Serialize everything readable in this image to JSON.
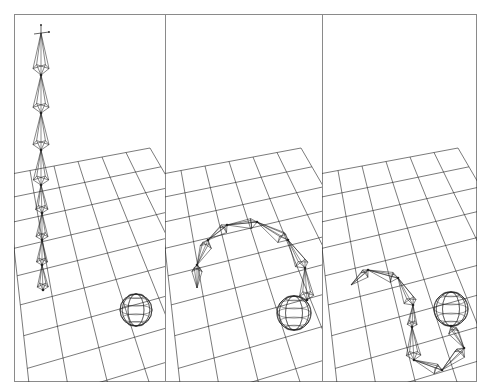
{
  "figure": {
    "colors": {
      "background": "#ffffff",
      "line": "#222222",
      "frame": "#8a8a8a"
    },
    "frame": {
      "x": 14,
      "y": 14,
      "width": 463,
      "height": 368
    },
    "panels": [
      {
        "id": "panel-1",
        "label": "Initial pose: chain straight up",
        "x": 14,
        "width": 151,
        "chain_joints": [
          [
            41,
            33
          ],
          [
            41,
            75
          ],
          [
            41,
            113
          ],
          [
            41,
            150
          ],
          [
            41,
            185
          ],
          [
            42,
            213
          ],
          [
            42,
            240
          ],
          [
            42,
            265
          ],
          [
            43,
            290
          ]
        ],
        "target_sphere": {
          "cx": 136,
          "cy": 310,
          "r": 16
        },
        "has_axis_gizmo": true
      },
      {
        "id": "panel-2",
        "label": "Intermediate pose: chain arcs toward sphere",
        "x": 165,
        "width": 157,
        "chain_joints": [
          [
            197,
            288
          ],
          [
            197,
            265
          ],
          [
            208,
            240
          ],
          [
            227,
            225
          ],
          [
            257,
            222
          ],
          [
            288,
            240
          ],
          [
            305,
            268
          ],
          [
            307,
            300
          ]
        ],
        "target_sphere": {
          "cx": 294,
          "cy": 313,
          "r": 17
        },
        "has_axis_gizmo": false
      },
      {
        "id": "panel-3",
        "label": "Final pose: chain reaches sphere",
        "x": 322,
        "width": 155,
        "chain_joints": [
          [
            351,
            285
          ],
          [
            368,
            270
          ],
          [
            398,
            278
          ],
          [
            413,
            305
          ],
          [
            412,
            327
          ],
          [
            414,
            360
          ],
          [
            442,
            370
          ],
          [
            464,
            348
          ],
          [
            451,
            326
          ]
        ],
        "target_sphere": {
          "cx": 451,
          "cy": 309,
          "r": 17
        },
        "has_axis_gizmo": false
      }
    ],
    "grid": {
      "cells": 11,
      "far_left_dy": 175,
      "far_right_dx": 136,
      "far_right_dy": 148
    }
  }
}
